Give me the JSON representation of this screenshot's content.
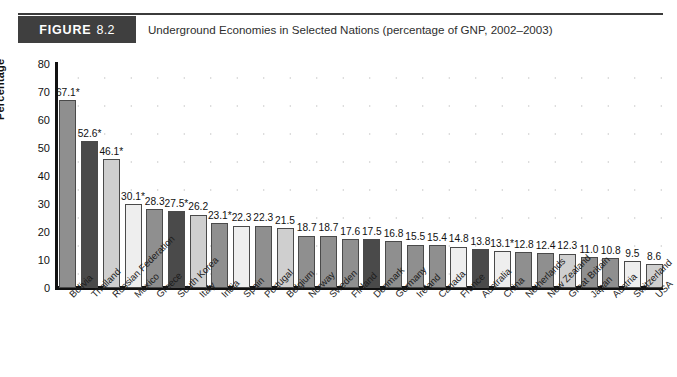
{
  "header": {
    "figure_word": "FIGURE",
    "figure_number": "8.2",
    "caption": "Underground Economies in Selected Nations (percentage of GNP, 2002–2003)"
  },
  "colors": {
    "tag_background": "#3f3f3f",
    "tag_text": "#ffffff",
    "axis": "#111111",
    "grid_dot": "#c9c9c9",
    "bar_dark": "#4a4a4a",
    "bar_medium": "#8f8f8f",
    "bar_light": "#cfcfcf",
    "bar_pale": "#eeeeee",
    "bar_outline": "#4a4a4a"
  },
  "chart_data": {
    "type": "bar",
    "title": "Underground Economies in Selected Nations (percentage of GNP, 2002–2003)",
    "xlabel": "",
    "ylabel": "Percentage",
    "ylim": [
      0,
      80
    ],
    "yticks": [
      0,
      10,
      20,
      30,
      40,
      50,
      60,
      70,
      80
    ],
    "ytick_labels": [
      "0",
      "10",
      "20",
      "30",
      "40",
      "50",
      "60",
      "70",
      "80"
    ],
    "grid": "dotted",
    "legend": "none",
    "categories": [
      "Bolivia",
      "Thailand",
      "Russian Federation",
      "Mexico",
      "Greece",
      "South Korea",
      "Italy",
      "India",
      "Spain",
      "Portugal",
      "Belgium",
      "Norway",
      "Sweden",
      "Finland",
      "Denmark",
      "Germany",
      "Ireland",
      "Canada",
      "France",
      "Australia",
      "China",
      "Netherlands",
      "New Zealand",
      "Great Britain",
      "Japan",
      "Austria",
      "Switzerland",
      "USA"
    ],
    "values": [
      67.1,
      52.6,
      46.1,
      30.1,
      28.3,
      27.5,
      26.2,
      23.1,
      22.3,
      22.3,
      21.5,
      18.7,
      18.7,
      17.6,
      17.5,
      16.8,
      15.5,
      15.4,
      14.8,
      13.8,
      13.1,
      12.8,
      12.4,
      12.3,
      11.0,
      10.8,
      9.5,
      8.6
    ],
    "data_labels": [
      "67.1*",
      "52.6*",
      "46.1*",
      "30.1*",
      "28.3",
      "27.5*",
      "26.2",
      "23.1*",
      "22.3",
      "22.3",
      "21.5",
      "18.7",
      "18.7",
      "17.6",
      "17.5",
      "16.8",
      "15.5",
      "15.4",
      "14.8",
      "13.8",
      "13.1*",
      "12.8",
      "12.4",
      "12.3",
      "11.0",
      "10.8",
      "9.5",
      "8.6"
    ],
    "bar_shades": [
      "medium",
      "dark",
      "light",
      "pale",
      "medium",
      "dark",
      "light",
      "medium",
      "pale",
      "medium",
      "light",
      "medium",
      "medium",
      "medium",
      "dark",
      "medium",
      "medium",
      "medium",
      "pale",
      "dark",
      "pale",
      "medium",
      "medium",
      "light",
      "medium",
      "medium",
      "pale",
      "light"
    ]
  }
}
